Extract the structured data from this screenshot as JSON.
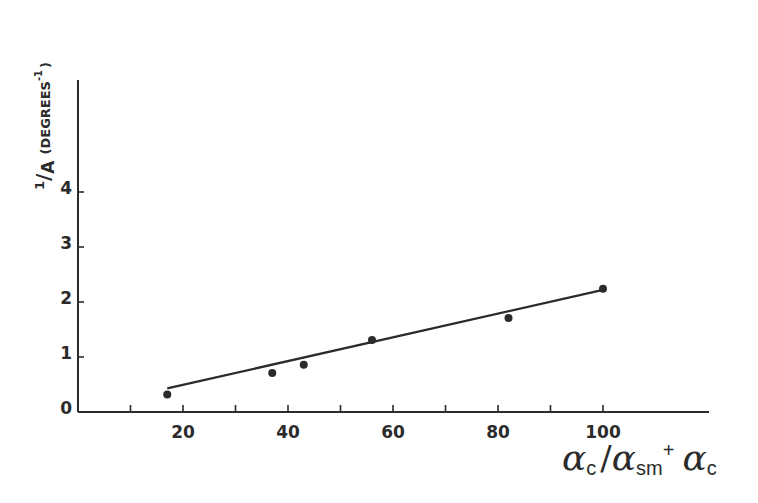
{
  "chart_data": {
    "type": "scatter",
    "title": "",
    "xlabel": "αc / αsm + αc",
    "ylabel": "1/A (DEGREES⁻¹)",
    "x_ticks": [
      20,
      40,
      60,
      80,
      100
    ],
    "x_minor_ticks": [
      10,
      30,
      50,
      70,
      90
    ],
    "y_ticks": [
      0,
      1,
      2,
      3,
      4
    ],
    "xlim": [
      0,
      120
    ],
    "ylim": [
      0,
      6
    ],
    "grid": false,
    "legend": null,
    "series": [
      {
        "name": "data points",
        "type": "scatter",
        "x": [
          17,
          37,
          43,
          56,
          82,
          100
        ],
        "y": [
          0.32,
          0.71,
          0.86,
          1.31,
          1.71,
          2.24
        ]
      },
      {
        "name": "linear fit",
        "type": "line",
        "x": [
          17,
          100
        ],
        "y": [
          0.43,
          2.22
        ]
      }
    ]
  },
  "labels": {
    "y_axis": {
      "numerator": "1",
      "slash": "/",
      "denominator": "A",
      "unit": "(DEGREES",
      "exponent": "-1",
      "close": ")"
    },
    "x_axis": {
      "alpha1": "α",
      "sub1": "c",
      "slash": "/",
      "alpha2": "α",
      "sub2": "sm",
      "plus": "+",
      "alpha3": "α",
      "sub3": "c"
    },
    "x_tick_labels": [
      "20",
      "40",
      "60",
      "80",
      "100"
    ],
    "y_tick_labels": [
      "0",
      "1",
      "2",
      "3",
      "4"
    ]
  },
  "colors": {
    "ink": "#2b2b2b",
    "background": "#ffffff"
  }
}
